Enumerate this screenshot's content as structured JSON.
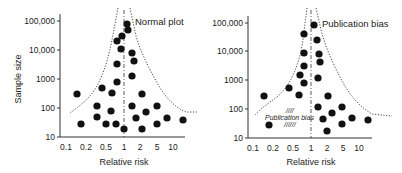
{
  "chart_data": [
    {
      "type": "scatter",
      "title": "Normal plot",
      "xlabel": "Relative risk",
      "ylabel": "Sample size",
      "xscale": "log",
      "yscale": "log",
      "x_ticks": [
        "0.1",
        "0.2",
        "0.5",
        "1",
        "2",
        "5",
        "10"
      ],
      "y_ticks": [
        "10",
        "100",
        "1000",
        "10,000",
        "100,000"
      ],
      "reference_line_x": 1,
      "funnel": "dotted funnel boundary narrowing toward large sample sizes",
      "points": [
        {
          "x": 1.0,
          "y": 80000
        },
        {
          "x": 1.05,
          "y": 50000
        },
        {
          "x": 0.85,
          "y": 30000
        },
        {
          "x": 0.7,
          "y": 20000
        },
        {
          "x": 0.8,
          "y": 11000
        },
        {
          "x": 1.4,
          "y": 8000
        },
        {
          "x": 1.5,
          "y": 4000
        },
        {
          "x": 0.7,
          "y": 3000
        },
        {
          "x": 1.4,
          "y": 1200
        },
        {
          "x": 0.7,
          "y": 750
        },
        {
          "x": 0.5,
          "y": 480
        },
        {
          "x": 0.15,
          "y": 280
        },
        {
          "x": 0.6,
          "y": 280
        },
        {
          "x": 2.0,
          "y": 280
        },
        {
          "x": 0.4,
          "y": 110
        },
        {
          "x": 0.7,
          "y": 70
        },
        {
          "x": 1.3,
          "y": 110
        },
        {
          "x": 2.5,
          "y": 70
        },
        {
          "x": 4.0,
          "y": 110
        },
        {
          "x": 0.17,
          "y": 28
        },
        {
          "x": 0.4,
          "y": 42
        },
        {
          "x": 0.5,
          "y": 28
        },
        {
          "x": 0.7,
          "y": 28
        },
        {
          "x": 1.0,
          "y": 18
        },
        {
          "x": 1.7,
          "y": 42
        },
        {
          "x": 2.0,
          "y": 18
        },
        {
          "x": 4.0,
          "y": 28
        },
        {
          "x": 6.0,
          "y": 42
        },
        {
          "x": 13.0,
          "y": 36
        }
      ]
    },
    {
      "type": "scatter",
      "title": "Publication bias",
      "xlabel": "Relative risk",
      "ylabel": "",
      "xscale": "log",
      "yscale": "log",
      "x_ticks": [
        "0.1",
        "0.2",
        "0.5",
        "1",
        "2",
        "5",
        "10"
      ],
      "y_ticks": [
        "10",
        "100",
        "1000",
        "10,000",
        "100,000"
      ],
      "reference_line_x": 1,
      "annotation": "Publication bias",
      "funnel": "dotted funnel boundary with missing small studies in lower left",
      "points": [
        {
          "x": 1.0,
          "y": 80000
        },
        {
          "x": 0.7,
          "y": 40000
        },
        {
          "x": 1.1,
          "y": 25000
        },
        {
          "x": 0.7,
          "y": 9000
        },
        {
          "x": 1.15,
          "y": 8000
        },
        {
          "x": 1.2,
          "y": 4000
        },
        {
          "x": 0.7,
          "y": 2800
        },
        {
          "x": 0.6,
          "y": 1500
        },
        {
          "x": 1.15,
          "y": 1200
        },
        {
          "x": 0.7,
          "y": 800
        },
        {
          "x": 0.5,
          "y": 480
        },
        {
          "x": 0.15,
          "y": 280
        },
        {
          "x": 0.6,
          "y": 280
        },
        {
          "x": 2.0,
          "y": 280
        },
        {
          "x": 1.5,
          "y": 110
        },
        {
          "x": 2.3,
          "y": 70
        },
        {
          "x": 4.0,
          "y": 110
        },
        {
          "x": 0.18,
          "y": 28
        },
        {
          "x": 1.8,
          "y": 42
        },
        {
          "x": 2.0,
          "y": 18
        },
        {
          "x": 4.0,
          "y": 28
        },
        {
          "x": 6.0,
          "y": 42
        },
        {
          "x": 13.0,
          "y": 36
        }
      ]
    }
  ],
  "left": {
    "title": "Normal plot",
    "xlabel": "Relative risk",
    "ylabel": "Sample size",
    "y_ticks": [
      {
        "label": "100,000",
        "y": 21
      },
      {
        "label": "10,000",
        "y": 50
      },
      {
        "label": "1000",
        "y": 79
      },
      {
        "label": "100",
        "y": 108
      },
      {
        "label": "10",
        "y": 137
      }
    ],
    "x_ticks": [
      {
        "label": "0.1",
        "x": 66
      },
      {
        "label": "0.2",
        "x": 86
      },
      {
        "label": "0.5",
        "x": 106
      },
      {
        "label": "1",
        "x": 124
      },
      {
        "label": "2",
        "x": 140
      },
      {
        "label": "5",
        "x": 157
      },
      {
        "label": "10",
        "x": 173
      }
    ],
    "dots": [
      [
        127,
        24
      ],
      [
        128,
        30
      ],
      [
        122,
        36
      ],
      [
        117,
        41
      ],
      [
        121,
        49
      ],
      [
        132,
        53
      ],
      [
        134,
        61
      ],
      [
        117,
        64
      ],
      [
        132,
        76
      ],
      [
        117,
        82
      ],
      [
        102,
        88
      ],
      [
        77,
        94
      ],
      [
        112,
        93
      ],
      [
        142,
        94
      ],
      [
        97,
        106
      ],
      [
        111,
        111
      ],
      [
        132,
        106
      ],
      [
        146,
        112
      ],
      [
        157,
        106
      ],
      [
        81,
        124
      ],
      [
        97,
        117
      ],
      [
        106,
        124
      ],
      [
        116,
        124
      ],
      [
        124,
        129
      ],
      [
        136,
        118
      ],
      [
        142,
        129
      ],
      [
        157,
        124
      ],
      [
        167,
        118
      ],
      [
        183,
        120
      ]
    ]
  },
  "right": {
    "title": "Publication bias",
    "xlabel": "Relative risk",
    "annotation": "Publication bias",
    "y_ticks": [
      {
        "label": "100,000",
        "y": 23
      },
      {
        "label": "10,000",
        "y": 51
      },
      {
        "label": "1000",
        "y": 80
      },
      {
        "label": "100",
        "y": 109
      },
      {
        "label": "10",
        "y": 138
      }
    ],
    "x_ticks": [
      {
        "label": "0.1",
        "x": 253
      },
      {
        "label": "0.2",
        "x": 273
      },
      {
        "label": "0.5",
        "x": 293
      },
      {
        "label": "1",
        "x": 311
      },
      {
        "label": "2",
        "x": 327
      },
      {
        "label": "5",
        "x": 343
      },
      {
        "label": "10",
        "x": 359
      }
    ],
    "dots": [
      [
        314,
        25
      ],
      [
        304,
        34
      ],
      [
        317,
        40
      ],
      [
        304,
        53
      ],
      [
        319,
        54
      ],
      [
        320,
        62
      ],
      [
        304,
        66
      ],
      [
        300,
        75
      ],
      [
        318,
        78
      ],
      [
        304,
        83
      ],
      [
        289,
        88
      ],
      [
        264,
        96
      ],
      [
        299,
        95
      ],
      [
        328,
        96
      ],
      [
        318,
        107
      ],
      [
        332,
        113
      ],
      [
        342,
        107
      ],
      [
        269,
        125
      ],
      [
        323,
        119
      ],
      [
        327,
        131
      ],
      [
        342,
        124
      ],
      [
        352,
        118
      ],
      [
        368,
        120
      ]
    ]
  }
}
